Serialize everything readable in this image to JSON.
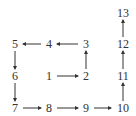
{
  "diagram": {
    "type": "spiral-sequence",
    "nodes": [
      {
        "id": "1",
        "label": "1",
        "x": 49,
        "y": 76
      },
      {
        "id": "2",
        "label": "2",
        "x": 86,
        "y": 76
      },
      {
        "id": "3",
        "label": "3",
        "x": 86,
        "y": 44
      },
      {
        "id": "4",
        "label": "4",
        "x": 49,
        "y": 44
      },
      {
        "id": "5",
        "label": "5",
        "x": 15,
        "y": 44
      },
      {
        "id": "6",
        "label": "6",
        "x": 15,
        "y": 76
      },
      {
        "id": "7",
        "label": "7",
        "x": 15,
        "y": 108
      },
      {
        "id": "8",
        "label": "8",
        "x": 49,
        "y": 108
      },
      {
        "id": "9",
        "label": "9",
        "x": 86,
        "y": 108
      },
      {
        "id": "10",
        "label": "10",
        "x": 123,
        "y": 108
      },
      {
        "id": "11",
        "label": "11",
        "x": 123,
        "y": 76
      },
      {
        "id": "12",
        "label": "12",
        "x": 123,
        "y": 44
      },
      {
        "id": "13",
        "label": "13",
        "x": 123,
        "y": 13
      }
    ],
    "edges": [
      {
        "from": "1",
        "to": "2"
      },
      {
        "from": "2",
        "to": "3"
      },
      {
        "from": "3",
        "to": "4"
      },
      {
        "from": "4",
        "to": "5"
      },
      {
        "from": "5",
        "to": "6"
      },
      {
        "from": "6",
        "to": "7"
      },
      {
        "from": "7",
        "to": "8"
      },
      {
        "from": "8",
        "to": "9"
      },
      {
        "from": "9",
        "to": "10"
      },
      {
        "from": "10",
        "to": "11"
      },
      {
        "from": "11",
        "to": "12"
      },
      {
        "from": "12",
        "to": "13"
      }
    ],
    "colors": {
      "stroke": "#333333",
      "text": "#333333",
      "background": "#ffffff"
    }
  }
}
